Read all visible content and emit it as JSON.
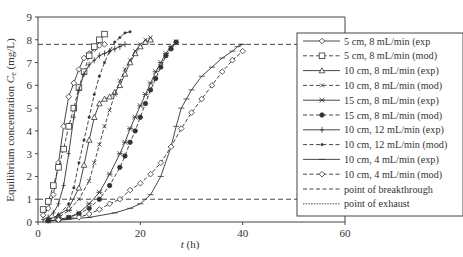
{
  "chart_data": {
    "type": "line",
    "title": "",
    "xlabel": "t (h)",
    "ylabel": "Equilibrium concentration C_e (mg/L)",
    "ylabel_main": "Equilibrium concentration ",
    "ylabel_sym": "C",
    "ylabel_sub": "e",
    "ylabel_unit": " (mg/L)",
    "xlabel_sym": "t",
    "xlabel_unit": " (h)",
    "xlim": [
      0,
      60
    ],
    "ylim": [
      0,
      9
    ],
    "xticks": [
      0,
      20,
      40,
      60
    ],
    "yticks": [
      0,
      1,
      2,
      3,
      4,
      5,
      6,
      7,
      8,
      9
    ],
    "grid": false,
    "legend_position": "right",
    "reference_lines": [
      {
        "name": "point of breakthrough",
        "y": 1.0,
        "style": "dashed"
      },
      {
        "name": "point of exhaust",
        "y": 7.8,
        "style": "dashed"
      }
    ],
    "series": [
      {
        "name": "5 cm, 8 mL/min (exp)",
        "line": "solid",
        "marker": "diamond-open",
        "x": [
          1,
          2,
          3,
          4,
          5,
          6,
          7,
          8,
          9,
          10,
          11,
          12,
          13
        ],
        "y": [
          0.3,
          0.6,
          1.2,
          2.6,
          4.2,
          5.5,
          6.1,
          6.7,
          7.2,
          7.4,
          7.6,
          7.75,
          7.8
        ]
      },
      {
        "name": "5 cm, 8 mL/min (mod)",
        "line": "dashed",
        "marker": "square-open",
        "x": [
          1,
          2,
          3,
          4,
          5,
          6,
          7,
          8,
          9,
          10,
          11,
          12,
          13
        ],
        "y": [
          0.55,
          0.9,
          1.6,
          2.4,
          3.2,
          4.2,
          5.0,
          5.9,
          6.6,
          7.3,
          7.7,
          8.0,
          8.25
        ]
      },
      {
        "name": "10 cm, 8 mL/min (exp)",
        "line": "solid",
        "marker": "triangle-open",
        "x": [
          2,
          4,
          6,
          8,
          9,
          10,
          11,
          12,
          13,
          14,
          15,
          16,
          17,
          18,
          19,
          20,
          21,
          22
        ],
        "y": [
          0.1,
          0.3,
          0.6,
          1.5,
          2.5,
          3.6,
          4.6,
          5.2,
          5.4,
          5.5,
          5.7,
          6.0,
          6.5,
          7.0,
          7.4,
          7.7,
          7.9,
          8.0
        ]
      },
      {
        "name": "10 cm, 8 mL/min (mod)",
        "line": "dashed",
        "marker": "x",
        "x": [
          2,
          4,
          6,
          8,
          10,
          11,
          12,
          13,
          14,
          15,
          16,
          17,
          18,
          19,
          20,
          21,
          22
        ],
        "y": [
          0.1,
          0.2,
          0.5,
          1.0,
          1.8,
          2.6,
          3.4,
          4.2,
          4.9,
          5.6,
          6.2,
          6.7,
          7.1,
          7.5,
          7.8,
          8.0,
          8.1
        ]
      },
      {
        "name": "15 cm, 8 mL/min (exp)",
        "line": "solid",
        "marker": "asterisk",
        "x": [
          2,
          4,
          6,
          8,
          10,
          12,
          14,
          16,
          17,
          18,
          19,
          20,
          21,
          22,
          23,
          24,
          25,
          26,
          27
        ],
        "y": [
          0.05,
          0.1,
          0.2,
          0.4,
          0.8,
          1.3,
          2.1,
          3.0,
          3.5,
          4.1,
          4.6,
          5.1,
          5.6,
          6.1,
          6.6,
          7.0,
          7.4,
          7.7,
          7.9
        ]
      },
      {
        "name": "15 cm, 8 mL/min (mod)",
        "line": "dashed",
        "marker": "dot-filled",
        "x": [
          2,
          4,
          6,
          8,
          10,
          12,
          14,
          16,
          17,
          18,
          19,
          20,
          21,
          22,
          23,
          24,
          25,
          26,
          27
        ],
        "y": [
          0.05,
          0.1,
          0.2,
          0.35,
          0.6,
          1.0,
          1.6,
          2.4,
          2.9,
          3.5,
          4.0,
          4.6,
          5.2,
          5.8,
          6.3,
          6.8,
          7.3,
          7.6,
          7.9
        ]
      },
      {
        "name": "10 cm, 12 mL/min (exp)",
        "line": "solid",
        "marker": "plus",
        "x": [
          1,
          2,
          3,
          4,
          5,
          6,
          7,
          8,
          9,
          10,
          11,
          12,
          13,
          14,
          15,
          16,
          17
        ],
        "y": [
          0.1,
          0.2,
          0.4,
          0.8,
          1.6,
          3.0,
          4.6,
          5.8,
          6.5,
          6.9,
          7.1,
          7.3,
          7.4,
          7.5,
          7.6,
          7.7,
          7.8
        ]
      },
      {
        "name": "10 cm, 12 mL/min (mod)",
        "line": "dashed",
        "marker": "dot-small",
        "x": [
          2,
          4,
          6,
          7,
          8,
          9,
          10,
          11,
          12,
          13,
          14,
          15,
          16,
          17,
          18
        ],
        "y": [
          0.1,
          0.3,
          0.8,
          1.5,
          2.6,
          3.6,
          4.6,
          5.6,
          6.4,
          7.0,
          7.5,
          7.9,
          8.1,
          8.3,
          8.35
        ]
      },
      {
        "name": "10 cm, 4 mL/min (exp)",
        "line": "solid",
        "marker": "hline",
        "x": [
          2,
          5,
          10,
          15,
          18,
          20,
          22,
          24,
          26,
          27,
          28,
          29,
          30,
          32,
          34,
          36,
          38,
          39,
          40
        ],
        "y": [
          0.05,
          0.1,
          0.2,
          0.4,
          0.6,
          0.8,
          1.2,
          2.0,
          3.3,
          4.2,
          5.0,
          5.4,
          5.8,
          6.4,
          6.8,
          7.2,
          7.5,
          7.7,
          7.8
        ]
      },
      {
        "name": "10 cm, 4 mL/min (mod)",
        "line": "dashed",
        "marker": "diamond-open",
        "x": [
          4,
          8,
          10,
          12,
          14,
          16,
          18,
          20,
          22,
          24,
          26,
          28,
          30,
          32,
          34,
          36,
          38,
          40
        ],
        "y": [
          0.1,
          0.2,
          0.35,
          0.55,
          0.8,
          1.0,
          1.4,
          1.7,
          2.1,
          2.6,
          3.3,
          4.1,
          4.8,
          5.4,
          6.0,
          6.6,
          7.1,
          7.5
        ]
      }
    ]
  },
  "legend": {
    "items": [
      {
        "label": "5 cm, 8 mL/min (exp",
        "line": "solid",
        "marker": "diamond-open"
      },
      {
        "label": "5 cm, 8 mL/min (mod)",
        "line": "dashed",
        "marker": "square-open"
      },
      {
        "label": "10 cm, 8 mL/min (exp)",
        "line": "solid",
        "marker": "triangle-open"
      },
      {
        "label": "10 cm, 8 mL/min (mod)",
        "line": "dashed",
        "marker": "x"
      },
      {
        "label": "15 cm, 8 mL/min (exp)",
        "line": "solid",
        "marker": "asterisk"
      },
      {
        "label": "15 cm, 8 mL/min (mod)",
        "line": "dashed",
        "marker": "dot-filled"
      },
      {
        "label": "10 cm, 12 mL/min (exp)",
        "line": "solid",
        "marker": "plus"
      },
      {
        "label": "10 cm, 12 mL/min (mod)",
        "line": "dashed",
        "marker": "dot-small"
      },
      {
        "label": "10 cm, 4 mL/min (exp)",
        "line": "solid",
        "marker": "hline"
      },
      {
        "label": "10 cm, 4 mL/min (mod)",
        "line": "dashed",
        "marker": "diamond-open"
      },
      {
        "label": "point of breakthrough",
        "line": "dashed",
        "marker": "none"
      },
      {
        "label": "point of exhaust",
        "line": "dotted",
        "marker": "none"
      }
    ]
  },
  "colors": {
    "line": "#333333",
    "axis": "#444444",
    "background": "#ffffff"
  }
}
